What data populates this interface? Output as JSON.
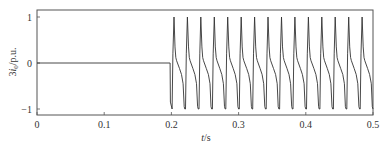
{
  "chart_data": {
    "type": "line",
    "title": "",
    "xlabel": "t/s",
    "ylabel": "3i0/p.u.",
    "xlabel_parts": {
      "var": "t",
      "unit": "/s"
    },
    "ylabel_parts": {
      "coef": "3",
      "var": "i",
      "sub": "0",
      "unit": "/p.u."
    },
    "xlim": [
      0,
      0.5
    ],
    "ylim": [
      -1.15,
      1.1
    ],
    "xticks": [
      0,
      0.1,
      0.2,
      0.3,
      0.4,
      0.5
    ],
    "xtick_labels": [
      "0",
      "0.1",
      "0.2",
      "0.3",
      "0.4",
      "0.5"
    ],
    "yticks": [
      -1,
      0,
      1
    ],
    "ytick_labels": [
      "−1",
      "0",
      "1"
    ],
    "grid": false,
    "legend": null,
    "line_color": "#333333",
    "series": [
      {
        "name": "3i0",
        "description": "Zero before fault; after t≈0.198 s a periodic distorted waveform at 50 Hz with sharp peaks ≈ +1 and troughs ≈ −1",
        "pre_fault": {
          "t": [
            0,
            0.198
          ],
          "value": 0
        },
        "fault_onset_t": 0.198,
        "period_s": 0.02,
        "num_cycles": 15,
        "peak_value": 1.0,
        "trough_value": -1.0,
        "peak_times": [
          0.206,
          0.226,
          0.245,
          0.265,
          0.284,
          0.304,
          0.324,
          0.343,
          0.343,
          0.363,
          0.383,
          0.402,
          0.422,
          0.442,
          0.461,
          0.481
        ],
        "cycle_shape": {
          "phase": [
            0.0,
            0.06,
            0.14,
            0.22,
            0.28,
            0.34,
            0.55,
            0.7,
            0.82,
            0.9,
            0.95,
            1.0
          ],
          "value": [
            -1.0,
            0.2,
            1.0,
            0.35,
            0.12,
            0.05,
            -0.12,
            -0.25,
            -0.45,
            -0.95,
            -1.0,
            -1.0
          ]
        }
      }
    ]
  }
}
